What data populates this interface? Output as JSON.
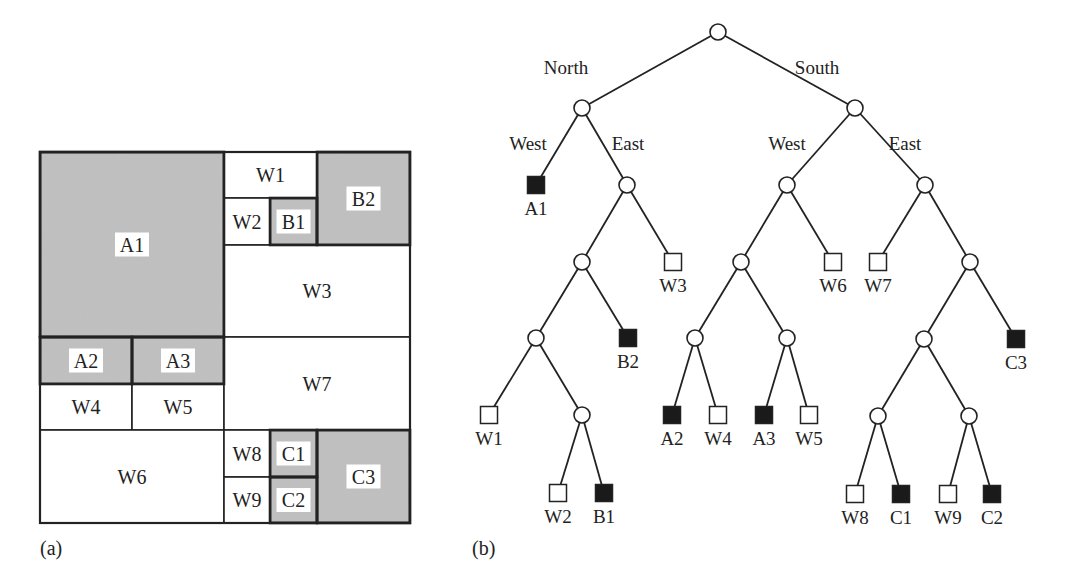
{
  "figure": {
    "colors": {
      "region_fill": "#bfbfbf",
      "white_fill": "#ffffff",
      "stroke": "#222222",
      "leaf_black": "#1a1a1a"
    },
    "panel_a": {
      "caption": "(a)",
      "outer_box": {
        "x": 40,
        "y": 152,
        "w": 370,
        "h": 371
      },
      "cells": [
        {
          "id": "A1",
          "label": "A1",
          "type": "region",
          "x": 40,
          "y": 152,
          "w": 184,
          "h": 185
        },
        {
          "id": "W1",
          "label": "W1",
          "type": "white",
          "x": 224,
          "y": 152,
          "w": 93,
          "h": 46
        },
        {
          "id": "B2",
          "label": "B2",
          "type": "region",
          "x": 317,
          "y": 152,
          "w": 93,
          "h": 93
        },
        {
          "id": "W2",
          "label": "W2",
          "type": "white",
          "x": 224,
          "y": 198,
          "w": 46,
          "h": 47
        },
        {
          "id": "B1",
          "label": "B1",
          "type": "region",
          "x": 270,
          "y": 198,
          "w": 47,
          "h": 47
        },
        {
          "id": "W3",
          "label": "W3",
          "type": "white",
          "x": 224,
          "y": 245,
          "w": 186,
          "h": 92
        },
        {
          "id": "A2",
          "label": "A2",
          "type": "region",
          "x": 40,
          "y": 337,
          "w": 92,
          "h": 47
        },
        {
          "id": "A3",
          "label": "A3",
          "type": "region",
          "x": 132,
          "y": 337,
          "w": 92,
          "h": 47
        },
        {
          "id": "W4",
          "label": "W4",
          "type": "white",
          "x": 40,
          "y": 384,
          "w": 92,
          "h": 46
        },
        {
          "id": "W5",
          "label": "W5",
          "type": "white",
          "x": 132,
          "y": 384,
          "w": 92,
          "h": 46
        },
        {
          "id": "W7",
          "label": "W7",
          "type": "white",
          "x": 224,
          "y": 337,
          "w": 186,
          "h": 93
        },
        {
          "id": "W6",
          "label": "W6",
          "type": "white",
          "x": 40,
          "y": 430,
          "w": 184,
          "h": 93
        },
        {
          "id": "W8",
          "label": "W8",
          "type": "white",
          "x": 224,
          "y": 430,
          "w": 46,
          "h": 47
        },
        {
          "id": "C1",
          "label": "C1",
          "type": "region",
          "x": 270,
          "y": 430,
          "w": 47,
          "h": 47
        },
        {
          "id": "W9",
          "label": "W9",
          "type": "white",
          "x": 224,
          "y": 477,
          "w": 46,
          "h": 46
        },
        {
          "id": "C2",
          "label": "C2",
          "type": "region",
          "x": 270,
          "y": 477,
          "w": 47,
          "h": 46
        },
        {
          "id": "C3",
          "label": "C3",
          "type": "region",
          "x": 317,
          "y": 430,
          "w": 93,
          "h": 93
        }
      ]
    },
    "panel_b": {
      "caption": "(b)",
      "nodes": [
        {
          "id": "root",
          "kind": "internal",
          "x": 718,
          "y": 32
        },
        {
          "id": "N",
          "kind": "internal",
          "x": 582,
          "y": 108
        },
        {
          "id": "S",
          "kind": "internal",
          "x": 855,
          "y": 108
        },
        {
          "id": "A1",
          "kind": "black",
          "label": "A1",
          "x": 536,
          "y": 185
        },
        {
          "id": "NE",
          "kind": "internal",
          "x": 627,
          "y": 185
        },
        {
          "id": "NE1",
          "kind": "internal",
          "x": 582,
          "y": 262
        },
        {
          "id": "W3",
          "kind": "white",
          "label": "W3",
          "x": 673,
          "y": 262
        },
        {
          "id": "NE2",
          "kind": "internal",
          "x": 536,
          "y": 338
        },
        {
          "id": "B2",
          "kind": "black",
          "label": "B2",
          "x": 628,
          "y": 338
        },
        {
          "id": "W1",
          "kind": "white",
          "label": "W1",
          "x": 489,
          "y": 415
        },
        {
          "id": "NE3",
          "kind": "internal",
          "x": 582,
          "y": 415
        },
        {
          "id": "W2",
          "kind": "white",
          "label": "W2",
          "x": 558,
          "y": 493
        },
        {
          "id": "B1",
          "kind": "black",
          "label": "B1",
          "x": 604,
          "y": 493
        },
        {
          "id": "SW",
          "kind": "internal",
          "x": 787,
          "y": 185
        },
        {
          "id": "SE",
          "kind": "internal",
          "x": 925,
          "y": 185
        },
        {
          "id": "SW1",
          "kind": "internal",
          "x": 741,
          "y": 262
        },
        {
          "id": "W6",
          "kind": "white",
          "label": "W6",
          "x": 833,
          "y": 262
        },
        {
          "id": "SW2",
          "kind": "internal",
          "x": 695,
          "y": 338
        },
        {
          "id": "SW3",
          "kind": "internal",
          "x": 787,
          "y": 338
        },
        {
          "id": "A2",
          "kind": "black",
          "label": "A2",
          "x": 672,
          "y": 415
        },
        {
          "id": "W4",
          "kind": "white",
          "label": "W4",
          "x": 718,
          "y": 415
        },
        {
          "id": "A3",
          "kind": "black",
          "label": "A3",
          "x": 764,
          "y": 415
        },
        {
          "id": "W5",
          "kind": "white",
          "label": "W5",
          "x": 809,
          "y": 415
        },
        {
          "id": "W7",
          "kind": "white",
          "label": "W7",
          "x": 878,
          "y": 262
        },
        {
          "id": "SE1",
          "kind": "internal",
          "x": 970,
          "y": 262
        },
        {
          "id": "SE2",
          "kind": "internal",
          "x": 924,
          "y": 339
        },
        {
          "id": "C3",
          "kind": "black",
          "label": "C3",
          "x": 1016,
          "y": 339
        },
        {
          "id": "SE3",
          "kind": "internal",
          "x": 878,
          "y": 416
        },
        {
          "id": "SE4",
          "kind": "internal",
          "x": 969,
          "y": 416
        },
        {
          "id": "W8",
          "kind": "white",
          "label": "W8",
          "x": 855,
          "y": 494
        },
        {
          "id": "C1",
          "kind": "black",
          "label": "C1",
          "x": 901,
          "y": 494
        },
        {
          "id": "W9",
          "kind": "white",
          "label": "W9",
          "x": 948,
          "y": 494
        },
        {
          "id": "C2",
          "kind": "black",
          "label": "C2",
          "x": 992,
          "y": 494
        }
      ],
      "edges": [
        [
          "root",
          "N"
        ],
        [
          "root",
          "S"
        ],
        [
          "N",
          "A1"
        ],
        [
          "N",
          "NE"
        ],
        [
          "NE",
          "NE1"
        ],
        [
          "NE",
          "W3"
        ],
        [
          "NE1",
          "NE2"
        ],
        [
          "NE1",
          "B2"
        ],
        [
          "NE2",
          "W1"
        ],
        [
          "NE2",
          "NE3"
        ],
        [
          "NE3",
          "W2"
        ],
        [
          "NE3",
          "B1"
        ],
        [
          "S",
          "SW"
        ],
        [
          "S",
          "SE"
        ],
        [
          "SW",
          "SW1"
        ],
        [
          "SW",
          "W6"
        ],
        [
          "SW1",
          "SW2"
        ],
        [
          "SW1",
          "SW3"
        ],
        [
          "SW2",
          "A2"
        ],
        [
          "SW2",
          "W4"
        ],
        [
          "SW3",
          "A3"
        ],
        [
          "SW3",
          "W5"
        ],
        [
          "SE",
          "W7"
        ],
        [
          "SE",
          "SE1"
        ],
        [
          "SE1",
          "SE2"
        ],
        [
          "SE1",
          "C3"
        ],
        [
          "SE2",
          "SE3"
        ],
        [
          "SE2",
          "SE4"
        ],
        [
          "SE3",
          "W8"
        ],
        [
          "SE3",
          "C1"
        ],
        [
          "SE4",
          "W9"
        ],
        [
          "SE4",
          "C2"
        ]
      ],
      "edge_labels": [
        {
          "text": "North",
          "x": 566,
          "y": 74
        },
        {
          "text": "South",
          "x": 817,
          "y": 74
        },
        {
          "text": "West",
          "x": 528,
          "y": 150
        },
        {
          "text": "East",
          "x": 628,
          "y": 150
        },
        {
          "text": "West",
          "x": 787,
          "y": 150
        },
        {
          "text": "East",
          "x": 905,
          "y": 150
        }
      ]
    }
  }
}
